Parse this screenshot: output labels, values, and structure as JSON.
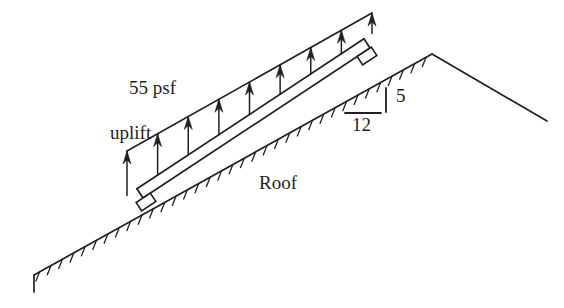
{
  "figure": {
    "background": "#ffffff",
    "ink": "#231f20",
    "width": 564,
    "height": 308
  },
  "labels": {
    "load_line1": "55 psf",
    "load_line2": "uplift",
    "roof": "Roof",
    "slope_rise": "5",
    "slope_run": "12"
  },
  "geometry": {
    "roof_beam": {
      "start": [
        143,
        198
      ],
      "end": [
        370,
        48
      ],
      "thickness": 11,
      "comment": "inclined double-line roof member, lower-left to upper-right"
    },
    "load_line": {
      "start": [
        127,
        151
      ],
      "end": [
        372,
        13
      ],
      "comment": "upper line where uplift arrow tips terminate"
    },
    "arrows": {
      "count": 9,
      "direction": "up",
      "head_length": 13,
      "head_width": 8,
      "tail_on": "roof_beam_top_edge",
      "tip_on": "load_line"
    },
    "supports": [
      {
        "name": "lower-left-bearing",
        "center": [
          146,
          202
        ],
        "w": 17,
        "h": 10,
        "angle": -33.4
      },
      {
        "name": "upper-right-bearing",
        "center": [
          367,
          56
        ],
        "w": 17,
        "h": 10,
        "angle": -33.4
      }
    ],
    "ground": {
      "left_toe": [
        34,
        275
      ],
      "left_toe_tick_bottom": [
        34,
        292
      ],
      "ridge": [
        432,
        54
      ],
      "right_toe": [
        547,
        121
      ],
      "hatch_side": "below",
      "hatch_spacing": 13,
      "hatch_length": 10,
      "hatched_segments": [
        "left_toe-to-ridge"
      ],
      "plain_segments": [
        "ridge-to-right_toe"
      ]
    },
    "slope_marker": {
      "vertical_tick": [
        [
          386,
          88
        ],
        [
          386,
          112
        ]
      ],
      "horizontal_line": [
        [
          345,
          113
        ],
        [
          381,
          113
        ]
      ]
    }
  },
  "chart_data": {
    "type": "diagram",
    "load_magnitude": 55,
    "load_units": "psf",
    "load_sense": "uplift",
    "roof_slope_rise": 5,
    "roof_slope_run": 12,
    "uplift_arrow_count": 9
  }
}
